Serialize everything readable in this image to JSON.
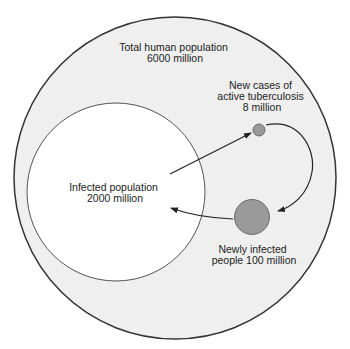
{
  "diagram": {
    "type": "nested-circle-flow",
    "colors": {
      "background": "#ffffff",
      "outer_fill": "#efefef",
      "inner_fill": "#ffffff",
      "node_fill": "#9a9a9a",
      "stroke": "#333333",
      "text": "#222222"
    },
    "nodes": {
      "total_population": {
        "line1": "Total human population",
        "line2": "6000 million"
      },
      "infected_population": {
        "line1": "Infected population",
        "line2": "2000 million"
      },
      "new_tb_cases": {
        "line1": "New cases of",
        "line2": "active tuberculosis",
        "line3": "8 million"
      },
      "newly_infected": {
        "line1": "Newly infected",
        "line2": "people 100 million"
      }
    },
    "edges": [
      {
        "from": "infected_population",
        "to": "new_tb_cases"
      },
      {
        "from": "new_tb_cases",
        "to": "newly_infected"
      },
      {
        "from": "newly_infected",
        "to": "infected_population"
      }
    ]
  }
}
